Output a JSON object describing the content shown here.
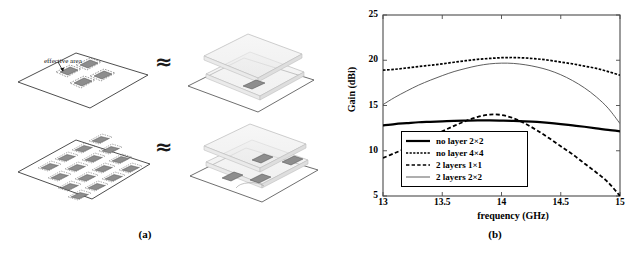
{
  "figure": {
    "panel_a_caption": "(a)",
    "panel_b_caption": "(b)",
    "approx_symbol_1": "≈",
    "approx_symbol_2": "≈"
  },
  "diagram": {
    "annotation_label": "effective area",
    "top_row": {
      "left_name": "substrate-with-2x2-patch-array",
      "right_name": "two-layer-stack-1x1-unit-cell",
      "patch_count": 4,
      "array": "2×2"
    },
    "bottom_row": {
      "left_name": "substrate-with-4x4-patch-array",
      "right_name": "two-layer-stack-2x2-unit-cell",
      "patch_count": 16,
      "array": "4×4"
    }
  },
  "chart_data": {
    "type": "line",
    "title": "",
    "xlabel": "frequency (GHz)",
    "ylabel": "Gain (dBi)",
    "xlim": [
      13,
      15
    ],
    "ylim": [
      5,
      25
    ],
    "xticks": [
      13,
      13.5,
      14,
      14.5,
      15
    ],
    "xticklabels": [
      "13",
      "13.5",
      "14",
      "14.5",
      "15"
    ],
    "yticks": [
      5,
      10,
      15,
      20,
      25
    ],
    "yticklabels": [
      "5",
      "10",
      "15",
      "20",
      "25"
    ],
    "grid": false,
    "legend_position": "lower center",
    "x": [
      13,
      13.1,
      13.2,
      13.3,
      13.4,
      13.5,
      13.6,
      13.7,
      13.8,
      13.9,
      14,
      14.1,
      14.2,
      14.3,
      14.4,
      14.5,
      14.6,
      14.7,
      14.8,
      14.9,
      15
    ],
    "series": [
      {
        "name": "no layer 2×2",
        "style": "solid-thick",
        "color": "#000000",
        "values": [
          12.8,
          12.95,
          13.05,
          13.15,
          13.2,
          13.25,
          13.3,
          13.33,
          13.35,
          13.35,
          13.33,
          13.3,
          13.25,
          13.18,
          13.08,
          12.95,
          12.8,
          12.65,
          12.48,
          12.3,
          12.15
        ]
      },
      {
        "name": "no layer 4×4",
        "style": "dashed-fine",
        "color": "#000000",
        "values": [
          18.9,
          19.0,
          19.15,
          19.3,
          19.45,
          19.6,
          19.78,
          19.95,
          20.1,
          20.2,
          20.28,
          20.3,
          20.25,
          20.15,
          20.0,
          19.8,
          19.6,
          19.35,
          19.1,
          18.75,
          18.35
        ]
      },
      {
        "name": "2 layers 1×1",
        "style": "dashed-coarse",
        "color": "#000000",
        "values": [
          9.2,
          9.75,
          10.3,
          10.9,
          11.5,
          12.15,
          12.75,
          13.3,
          13.75,
          14.0,
          13.95,
          13.6,
          13.0,
          12.25,
          11.4,
          10.5,
          9.6,
          8.6,
          7.6,
          6.5,
          5.0
        ]
      },
      {
        "name": "2 layers 2×2",
        "style": "solid-thin",
        "color": "#4d4d4d",
        "values": [
          15.1,
          15.9,
          16.6,
          17.25,
          17.8,
          18.3,
          18.75,
          19.1,
          19.4,
          19.6,
          19.68,
          19.65,
          19.5,
          19.25,
          18.9,
          18.4,
          17.75,
          16.95,
          15.95,
          14.7,
          13.0
        ]
      }
    ]
  }
}
